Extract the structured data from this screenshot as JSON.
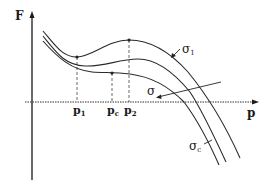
{
  "diagram": {
    "axes": {
      "y_label": "F",
      "x_label": "p"
    },
    "curves": [
      {
        "id": "sigma1",
        "label": "σ",
        "subscript": "1"
      },
      {
        "id": "sigma",
        "label": "σ",
        "subscript": ""
      },
      {
        "id": "sigmac",
        "label": "σ",
        "subscript": "c"
      }
    ],
    "x_markers": [
      {
        "id": "p1",
        "label": "p",
        "subscript": "1"
      },
      {
        "id": "pc",
        "label": "p",
        "subscript": "c"
      },
      {
        "id": "p2",
        "label": "p",
        "subscript": "2"
      }
    ],
    "colors": {
      "line": "#2a2a2a",
      "background": "#ffffff"
    }
  }
}
